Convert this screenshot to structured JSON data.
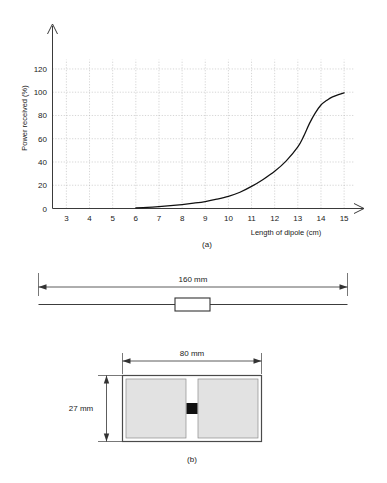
{
  "figure": {
    "panels": [
      {
        "id": "a",
        "caption": "(a)"
      },
      {
        "id": "b",
        "caption": "(b)"
      }
    ]
  },
  "chart_data": {
    "type": "line",
    "title": "",
    "xlabel": "Length of dipole (cm)",
    "ylabel": "Power received (%)",
    "xlim": [
      2.4,
      15.6
    ],
    "ylim": [
      0,
      132
    ],
    "xticks": [
      3,
      4,
      5,
      6,
      7,
      8,
      9,
      10,
      11,
      12,
      13,
      14,
      15
    ],
    "yticks": [
      0,
      20,
      40,
      60,
      80,
      100,
      120
    ],
    "xtick_labels": [
      "3",
      "4",
      "5",
      "6",
      "7",
      "8",
      "9",
      "10",
      "11",
      "12",
      "13",
      "14",
      "15"
    ],
    "ytick_labels": [
      "0",
      "20",
      "40",
      "60",
      "80",
      "100",
      "120"
    ],
    "grid": true,
    "legend": false,
    "legend_position": "none",
    "series": [
      {
        "name": "Power received",
        "color": "#111111",
        "x": [
          6.0,
          6.5,
          7.0,
          7.5,
          8.0,
          8.5,
          9.0,
          9.5,
          10.0,
          10.5,
          11.0,
          11.5,
          12.0,
          12.5,
          13.0,
          13.25,
          13.5,
          13.75,
          14.0,
          14.25,
          14.5,
          15.0
        ],
        "y": [
          0.5,
          1.0,
          1.6,
          2.4,
          3.4,
          4.6,
          6.0,
          8.0,
          10.5,
          14.0,
          19.0,
          25.0,
          32.0,
          41.0,
          53.0,
          62.0,
          73.0,
          82.0,
          89.0,
          93.0,
          96.0,
          99.5
        ]
      }
    ]
  },
  "dipole_diagram": {
    "dimension_label": "160 mm",
    "caption": "(a)"
  },
  "panel_diagram": {
    "width_label": "80 mm",
    "height_label": "27 mm",
    "caption": "(b)"
  },
  "colors": {
    "curve": "#111111",
    "grid": "#b9b9b9",
    "axis": "#3a3a3a",
    "plate_fill": "#e2e2e2",
    "plate_stroke": "#8c8c8c",
    "feed_point": "#111111",
    "background": "#ffffff"
  }
}
